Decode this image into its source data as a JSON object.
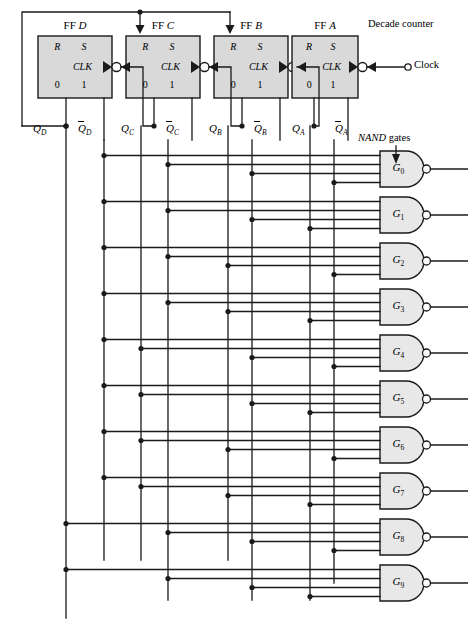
{
  "figure": {
    "captions": {
      "decade_counter": "Decade counter",
      "nand_gates_pre": "NAND",
      "nand_gates_post": " gates",
      "clock": "Clock"
    }
  },
  "colors": {
    "wire": "#1a1a1a",
    "box_fill": "#d9d9d9",
    "box_stroke": "#1a1a1a",
    "gate_fill": "#e8e8e8",
    "background": "#ffffff"
  },
  "flipflops": [
    {
      "id": "ffd",
      "prefix": "FF",
      "name": "D",
      "x": 38,
      "y": 36,
      "w": 74,
      "h": 62,
      "inputs": [
        "R",
        "S"
      ],
      "clk": "CLK",
      "outputs": [
        "0",
        "1"
      ],
      "q": "Q",
      "q_sub": "D",
      "qbar": "Q",
      "qbar_sub": "D",
      "q_x": 66,
      "qbar_x": 104
    },
    {
      "id": "ffc",
      "prefix": "FF",
      "name": "C",
      "x": 126,
      "y": 36,
      "w": 74,
      "h": 62,
      "inputs": [
        "R",
        "S"
      ],
      "clk": "CLK",
      "outputs": [
        "0",
        "1"
      ],
      "q": "Q",
      "q_sub": "C",
      "qbar": "Q",
      "qbar_sub": "C",
      "q_x": 154,
      "qbar_x": 192
    },
    {
      "id": "ffb",
      "prefix": "FF",
      "name": "B",
      "x": 214,
      "y": 36,
      "w": 74,
      "h": 62,
      "inputs": [
        "R",
        "S"
      ],
      "clk": "CLK",
      "outputs": [
        "0",
        "1"
      ],
      "q": "Q",
      "q_sub": "B",
      "qbar": "Q",
      "qbar_sub": "B",
      "q_x": 242,
      "qbar_x": 280
    },
    {
      "id": "ffa",
      "prefix": "FF",
      "name": "A",
      "x": 292,
      "y": 36,
      "w": 66,
      "h": 62,
      "inputs": [
        "R",
        "S"
      ],
      "clk": "CLK",
      "outputs": [
        "0",
        "1"
      ],
      "q": "Q",
      "q_sub": "A",
      "qbar": "Q",
      "qbar_sub": "A",
      "q_x": 314,
      "qbar_x": 348
    }
  ],
  "bus_lines": [
    {
      "name": "QD",
      "signal": "Q_D",
      "x": 66
    },
    {
      "name": "QDbar",
      "signal": "Qbar_D",
      "x": 104
    },
    {
      "name": "QC",
      "signal": "Q_C",
      "x": 141
    },
    {
      "name": "QCbar",
      "signal": "Qbar_C",
      "x": 168
    },
    {
      "name": "QB",
      "signal": "Q_B",
      "x": 228
    },
    {
      "name": "QBbar",
      "signal": "Qbar_B",
      "x": 252
    },
    {
      "name": "QA",
      "signal": "Q_A",
      "x": 310
    },
    {
      "name": "QAbar",
      "signal": "Qbar_A",
      "x": 334
    }
  ],
  "nand_gates": [
    {
      "label": "G",
      "sub": "0",
      "y": 169,
      "inputs": [
        "Qbar_D",
        "Qbar_C",
        "Qbar_B",
        "Qbar_A"
      ],
      "state": 0
    },
    {
      "label": "G",
      "sub": "1",
      "y": 215,
      "inputs": [
        "Qbar_D",
        "Qbar_C",
        "Qbar_B",
        "Q_A"
      ],
      "state": 1
    },
    {
      "label": "G",
      "sub": "2",
      "y": 261,
      "inputs": [
        "Qbar_D",
        "Qbar_C",
        "Q_B",
        "Qbar_A"
      ],
      "state": 2
    },
    {
      "label": "G",
      "sub": "3",
      "y": 307,
      "inputs": [
        "Qbar_D",
        "Qbar_C",
        "Q_B",
        "Q_A"
      ],
      "state": 3
    },
    {
      "label": "G",
      "sub": "4",
      "y": 353,
      "inputs": [
        "Qbar_D",
        "Q_C",
        "Qbar_B",
        "Qbar_A"
      ],
      "state": 4
    },
    {
      "label": "G",
      "sub": "5",
      "y": 399,
      "inputs": [
        "Qbar_D",
        "Q_C",
        "Qbar_B",
        "Q_A"
      ],
      "state": 5
    },
    {
      "label": "G",
      "sub": "6",
      "y": 445,
      "inputs": [
        "Qbar_D",
        "Q_C",
        "Q_B",
        "Qbar_A"
      ],
      "state": 6
    },
    {
      "label": "G",
      "sub": "7",
      "y": 491,
      "inputs": [
        "Qbar_D",
        "Q_C",
        "Q_B",
        "Q_A"
      ],
      "state": 7
    },
    {
      "label": "G",
      "sub": "8",
      "y": 537,
      "inputs": [
        "Q_D",
        "Qbar_C",
        "Qbar_B",
        "Qbar_A"
      ],
      "state": 8
    },
    {
      "label": "G",
      "sub": "9",
      "y": 583,
      "inputs": [
        "Q_D",
        "Qbar_C",
        "Qbar_B",
        "Q_A"
      ],
      "state": 9
    }
  ]
}
